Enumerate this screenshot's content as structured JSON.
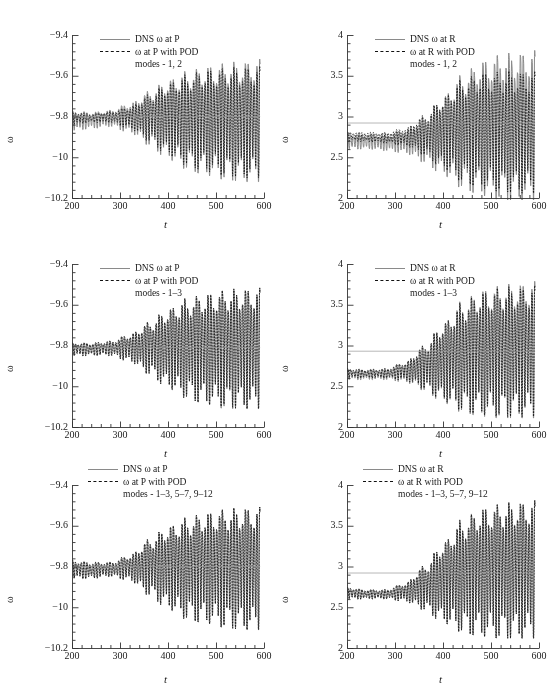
{
  "figure": {
    "colors": {
      "dns_gray": "#8a8a8a",
      "pod_black": "#111111",
      "axis": "#333333",
      "background": "#ffffff"
    }
  },
  "axes": {
    "xlabel": "t",
    "ylabel": "ω",
    "x_ticks": [
      "200",
      "300",
      "400",
      "500",
      "600"
    ],
    "x_range": [
      200,
      600
    ],
    "x_minor_per_major": 5,
    "y_ticks_P": [
      "−9.4",
      "−9.6",
      "−9.8",
      "−10",
      "−10.2"
    ],
    "y_range_P": [
      -10.2,
      -9.4
    ],
    "y_ticks_R": [
      "4",
      "3.5",
      "3",
      "2.5",
      "2"
    ],
    "y_range_R": [
      2,
      4
    ],
    "y_minor_per_major": 5
  },
  "chart_data": [
    {
      "id": "panel-top-left",
      "type": "line",
      "title": "",
      "xlabel": "t",
      "ylabel": "ω",
      "xlim": [
        200,
        600
      ],
      "ylim": [
        -10.2,
        -9.4
      ],
      "grid": false,
      "legend_position": "top-left-inside",
      "legend": [
        {
          "key": "solid-gray",
          "label": "DNS ω at P"
        },
        {
          "key": "dashed-black",
          "label": "ω at P with POD"
        },
        {
          "key": "none",
          "label": "modes - 1, 2"
        }
      ],
      "probe": "P",
      "modes_label": "modes - 1, 2",
      "mean_level": -9.8,
      "series": [
        {
          "name": "DNS ω at P",
          "style": "solid",
          "color": "#8a8a8a",
          "envelope_x": [
            200,
            240,
            280,
            320,
            360,
            400,
            440,
            480,
            520,
            560,
            590
          ],
          "envelope_upper": [
            -9.76,
            -9.77,
            -9.76,
            -9.72,
            -9.65,
            -9.58,
            -9.53,
            -9.5,
            -9.48,
            -9.47,
            -9.46
          ],
          "envelope_lower": [
            -9.87,
            -9.86,
            -9.85,
            -9.88,
            -9.94,
            -10.01,
            -10.06,
            -10.09,
            -10.11,
            -10.12,
            -10.12
          ],
          "carrier_period": 6.0,
          "beat_period": 26.0
        },
        {
          "name": "ω at P with POD modes - 1, 2",
          "style": "dashed",
          "color": "#111111",
          "envelope_x": [
            200,
            240,
            280,
            320,
            360,
            400,
            440,
            480,
            520,
            560,
            590
          ],
          "envelope_upper": [
            -9.77,
            -9.78,
            -9.77,
            -9.74,
            -9.67,
            -9.6,
            -9.55,
            -9.52,
            -9.51,
            -9.5,
            -9.5
          ],
          "envelope_lower": [
            -9.84,
            -9.83,
            -9.83,
            -9.86,
            -9.92,
            -9.99,
            -10.04,
            -10.07,
            -10.09,
            -10.1,
            -10.1
          ],
          "carrier_period": 6.0,
          "beat_period": 26.0
        }
      ]
    },
    {
      "id": "panel-top-right",
      "type": "line",
      "title": "",
      "xlabel": "t",
      "ylabel": "ω",
      "xlim": [
        200,
        600
      ],
      "ylim": [
        2,
        4
      ],
      "grid": false,
      "legend_position": "top-left-inside",
      "legend": [
        {
          "key": "solid-gray",
          "label": "DNS ω at R"
        },
        {
          "key": "dashed-black",
          "label": "ω at R with POD"
        },
        {
          "key": "none",
          "label": "modes - 1, 2"
        }
      ],
      "probe": "R",
      "modes_label": "modes - 1, 2",
      "mean_level": 2.92,
      "series": [
        {
          "name": "DNS ω at R",
          "style": "solid",
          "color": "#8a8a8a",
          "envelope_x": [
            200,
            240,
            280,
            320,
            360,
            400,
            440,
            480,
            520,
            560,
            590
          ],
          "envelope_upper": [
            2.8,
            2.8,
            2.8,
            2.86,
            3.05,
            3.35,
            3.65,
            3.85,
            3.94,
            3.97,
            3.99
          ],
          "envelope_lower": [
            2.6,
            2.6,
            2.58,
            2.55,
            2.44,
            2.28,
            2.12,
            2.03,
            1.98,
            1.96,
            1.96
          ],
          "carrier_period": 6.0,
          "beat_period": 26.0
        },
        {
          "name": "ω at R with POD modes - 1, 2",
          "style": "dashed",
          "color": "#111111",
          "envelope_x": [
            200,
            240,
            280,
            320,
            360,
            400,
            440,
            480,
            520,
            560,
            590
          ],
          "envelope_upper": [
            2.82,
            2.82,
            2.82,
            2.88,
            3.06,
            3.33,
            3.58,
            3.68,
            3.7,
            3.7,
            3.7
          ],
          "envelope_lower": [
            2.7,
            2.69,
            2.67,
            2.64,
            2.53,
            2.36,
            2.2,
            2.12,
            2.08,
            2.06,
            2.06
          ],
          "carrier_period": 6.0,
          "beat_period": 26.0
        }
      ]
    },
    {
      "id": "panel-mid-left",
      "type": "line",
      "title": "",
      "xlabel": "t",
      "ylabel": "ω",
      "xlim": [
        200,
        600
      ],
      "ylim": [
        -10.2,
        -9.4
      ],
      "grid": false,
      "legend_position": "top-left-inside",
      "legend": [
        {
          "key": "solid-gray",
          "label": "DNS ω at P"
        },
        {
          "key": "dashed-black",
          "label": "ω at P with POD"
        },
        {
          "key": "none",
          "label": "modes - 1–3"
        }
      ],
      "probe": "P",
      "modes_label": "modes - 1–3",
      "mean_level": -9.81,
      "series": [
        {
          "name": "DNS ω at P",
          "style": "solid",
          "color": "#8a8a8a",
          "envelope_x": [
            200,
            240,
            280,
            320,
            360,
            400,
            440,
            480,
            520,
            560,
            590
          ],
          "envelope_upper": [
            -9.78,
            -9.78,
            -9.77,
            -9.73,
            -9.66,
            -9.58,
            -9.52,
            -9.49,
            -9.47,
            -9.46,
            -9.46
          ],
          "envelope_lower": [
            -9.85,
            -9.85,
            -9.85,
            -9.88,
            -9.94,
            -10.01,
            -10.06,
            -10.09,
            -10.11,
            -10.11,
            -10.11
          ],
          "carrier_period": 6.0,
          "beat_period": 26.0
        },
        {
          "name": "ω at P with POD modes - 1–3",
          "style": "dashed",
          "color": "#111111",
          "envelope_x": [
            200,
            240,
            280,
            320,
            360,
            400,
            440,
            480,
            520,
            560,
            590
          ],
          "envelope_upper": [
            -9.78,
            -9.78,
            -9.77,
            -9.73,
            -9.66,
            -9.58,
            -9.52,
            -9.49,
            -9.47,
            -9.46,
            -9.46
          ],
          "envelope_lower": [
            -9.85,
            -9.85,
            -9.85,
            -9.88,
            -9.94,
            -10.01,
            -10.06,
            -10.09,
            -10.1,
            -10.11,
            -10.11
          ],
          "carrier_period": 6.0,
          "beat_period": 26.0
        }
      ]
    },
    {
      "id": "panel-mid-right",
      "type": "line",
      "title": "",
      "xlabel": "t",
      "ylabel": "ω",
      "xlim": [
        200,
        600
      ],
      "ylim": [
        2,
        4
      ],
      "grid": false,
      "legend_position": "top-left-inside",
      "legend": [
        {
          "key": "solid-gray",
          "label": "DNS ω at R"
        },
        {
          "key": "dashed-black",
          "label": "ω at R with POD"
        },
        {
          "key": "none",
          "label": "modes - 1–3"
        }
      ],
      "probe": "R",
      "modes_label": "modes - 1–3",
      "mean_level": 2.93,
      "series": [
        {
          "name": "DNS ω at R",
          "style": "solid",
          "color": "#8a8a8a",
          "envelope_x": [
            200,
            240,
            280,
            320,
            360,
            400,
            440,
            480,
            520,
            560,
            590
          ],
          "envelope_upper": [
            2.73,
            2.72,
            2.73,
            2.82,
            3.05,
            3.38,
            3.68,
            3.84,
            3.9,
            3.93,
            3.95
          ],
          "envelope_lower": [
            2.58,
            2.58,
            2.58,
            2.55,
            2.45,
            2.3,
            2.18,
            2.13,
            2.11,
            2.11,
            2.11
          ],
          "carrier_period": 6.0,
          "beat_period": 26.0
        },
        {
          "name": "ω at R with POD modes - 1–3",
          "style": "dashed",
          "color": "#111111",
          "envelope_x": [
            200,
            240,
            280,
            320,
            360,
            400,
            440,
            480,
            520,
            560,
            590
          ],
          "envelope_upper": [
            2.73,
            2.72,
            2.73,
            2.82,
            3.05,
            3.37,
            3.66,
            3.81,
            3.87,
            3.88,
            3.89
          ],
          "envelope_lower": [
            2.6,
            2.6,
            2.6,
            2.57,
            2.47,
            2.32,
            2.2,
            2.15,
            2.13,
            2.13,
            2.13
          ],
          "carrier_period": 6.0,
          "beat_period": 26.0
        }
      ]
    },
    {
      "id": "panel-bottom-left",
      "type": "line",
      "title": "",
      "xlabel": "t",
      "ylabel": "ω",
      "xlim": [
        200,
        600
      ],
      "ylim": [
        -10.2,
        -9.4
      ],
      "grid": false,
      "legend_position": "top-left-inside",
      "legend": [
        {
          "key": "solid-gray",
          "label": "DNS ω at P"
        },
        {
          "key": "dashed-black",
          "label": "ω at P with POD"
        },
        {
          "key": "none",
          "label": "modes - 1–3, 5–7, 9–12"
        }
      ],
      "probe": "P",
      "modes_label": "modes - 1–3, 5–7, 9–12",
      "mean_level": -9.8,
      "series": [
        {
          "name": "DNS ω at P",
          "style": "solid",
          "color": "#8a8a8a",
          "envelope_x": [
            200,
            240,
            280,
            320,
            360,
            400,
            440,
            480,
            520,
            560,
            590
          ],
          "envelope_upper": [
            -9.76,
            -9.77,
            -9.77,
            -9.73,
            -9.64,
            -9.56,
            -9.51,
            -9.48,
            -9.46,
            -9.45,
            -9.45
          ],
          "envelope_lower": [
            -9.86,
            -9.86,
            -9.85,
            -9.87,
            -9.94,
            -10.01,
            -10.06,
            -10.08,
            -10.1,
            -10.11,
            -10.11
          ],
          "carrier_period": 6.0,
          "beat_period": 26.0
        },
        {
          "name": "ω at P with POD modes - 1–3, 5–7, 9–12",
          "style": "dashed",
          "color": "#111111",
          "envelope_x": [
            200,
            240,
            280,
            320,
            360,
            400,
            440,
            480,
            520,
            560,
            590
          ],
          "envelope_upper": [
            -9.76,
            -9.77,
            -9.77,
            -9.73,
            -9.64,
            -9.56,
            -9.51,
            -9.48,
            -9.46,
            -9.45,
            -9.45
          ],
          "envelope_lower": [
            -9.86,
            -9.86,
            -9.85,
            -9.87,
            -9.94,
            -10.01,
            -10.06,
            -10.08,
            -10.1,
            -10.11,
            -10.11
          ],
          "carrier_period": 6.0,
          "beat_period": 26.0
        }
      ]
    },
    {
      "id": "panel-bottom-right",
      "type": "line",
      "title": "",
      "xlabel": "t",
      "ylabel": "ω",
      "xlim": [
        200,
        600
      ],
      "ylim": [
        2,
        4
      ],
      "grid": false,
      "legend_position": "top-left-inside",
      "legend": [
        {
          "key": "solid-gray",
          "label": "DNS ω at R"
        },
        {
          "key": "dashed-black",
          "label": "ω at R with POD"
        },
        {
          "key": "none",
          "label": "modes - 1–3, 5–7, 9–12"
        }
      ],
      "probe": "R",
      "modes_label": "modes - 1–3, 5–7, 9–12",
      "mean_level": 2.92,
      "series": [
        {
          "name": "DNS ω at R",
          "style": "solid",
          "color": "#8a8a8a",
          "envelope_x": [
            200,
            240,
            280,
            320,
            360,
            400,
            440,
            480,
            520,
            560,
            590
          ],
          "envelope_upper": [
            2.76,
            2.73,
            2.73,
            2.82,
            3.06,
            3.4,
            3.72,
            3.88,
            3.94,
            3.97,
            3.98
          ],
          "envelope_lower": [
            2.6,
            2.6,
            2.6,
            2.57,
            2.47,
            2.31,
            2.19,
            2.14,
            2.12,
            2.12,
            2.12
          ],
          "carrier_period": 6.0,
          "beat_period": 26.0
        },
        {
          "name": "ω at R with POD modes - 1–3, 5–7, 9–12",
          "style": "dashed",
          "color": "#111111",
          "envelope_x": [
            200,
            240,
            280,
            320,
            360,
            400,
            440,
            480,
            520,
            560,
            590
          ],
          "envelope_upper": [
            2.76,
            2.73,
            2.73,
            2.82,
            3.06,
            3.4,
            3.71,
            3.87,
            3.93,
            3.96,
            3.97
          ],
          "envelope_lower": [
            2.6,
            2.6,
            2.6,
            2.57,
            2.47,
            2.31,
            2.19,
            2.14,
            2.12,
            2.12,
            2.12
          ],
          "carrier_period": 6.0,
          "beat_period": 26.0
        }
      ]
    }
  ]
}
